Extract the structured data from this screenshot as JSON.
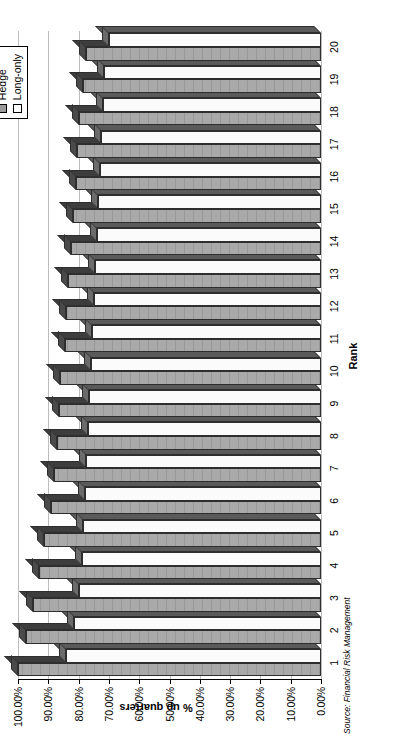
{
  "source_note": "Source: Financial Risk Management",
  "legend": {
    "position": "top-right",
    "items": [
      {
        "label": "Hedge",
        "color": "#9a9a9a"
      },
      {
        "label": "Long-only",
        "color": "#ffffff"
      }
    ]
  },
  "chart_data": {
    "type": "bar",
    "title": "",
    "xlabel": "Rank",
    "ylabel": "% up quarters",
    "ylim": [
      0,
      100
    ],
    "ytick_labels": [
      "0.00%",
      "10.00%",
      "20.00%",
      "30.00%",
      "40.00%",
      "50.00%",
      "60.00%",
      "70.00%",
      "80.00%",
      "90.00%",
      "100.00%"
    ],
    "ytick_values": [
      0,
      10,
      20,
      30,
      40,
      50,
      60,
      70,
      80,
      90,
      100
    ],
    "grid": true,
    "orientation": "vertical-columns-rotated-90ccw",
    "categories": [
      "1",
      "2",
      "3",
      "4",
      "5",
      "6",
      "7",
      "8",
      "9",
      "10",
      "11",
      "12",
      "13",
      "14",
      "15",
      "16",
      "17",
      "18",
      "19",
      "20"
    ],
    "series": [
      {
        "name": "Hedge",
        "color": "#9a9a9a",
        "values": [
          100.0,
          97.5,
          95.0,
          93.0,
          91.5,
          89.0,
          88.0,
          87.0,
          86.5,
          86.0,
          84.5,
          84.0,
          83.5,
          82.5,
          82.0,
          81.0,
          80.5,
          80.0,
          78.5,
          77.5
        ]
      },
      {
        "name": "Long-only",
        "color": "#ffffff",
        "values": [
          84.0,
          81.5,
          80.0,
          79.0,
          78.5,
          78.0,
          77.5,
          77.0,
          76.5,
          76.0,
          75.5,
          75.0,
          74.5,
          74.0,
          73.5,
          73.0,
          72.5,
          72.0,
          71.5,
          70.0
        ]
      }
    ]
  }
}
